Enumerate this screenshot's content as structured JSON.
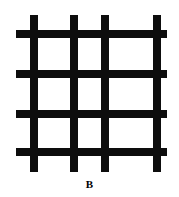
{
  "figure": {
    "label": "B",
    "label_position": {
      "center_x": 89,
      "baseline_y": 190
    },
    "label_font_size": 11,
    "canvas": {
      "width": 179,
      "height": 197
    },
    "background_color": "#ffffff",
    "stroke_color": "#0d0d0d",
    "bar_thickness": 8,
    "vertical_bars": [
      {
        "id": "v1",
        "x": 30,
        "y_start": 15,
        "y_end": 172
      },
      {
        "id": "v2",
        "x": 70,
        "y_start": 15,
        "y_end": 172
      },
      {
        "id": "v3",
        "x": 101,
        "y_start": 15,
        "y_end": 172
      },
      {
        "id": "v4",
        "x": 153,
        "y_start": 15,
        "y_end": 172
      }
    ],
    "horizontal_bars": [
      {
        "id": "h1",
        "y": 30,
        "x_start": 16,
        "x_end": 167
      },
      {
        "id": "h2",
        "y": 70,
        "x_start": 16,
        "x_end": 167
      },
      {
        "id": "h3",
        "y": 110,
        "x_start": 16,
        "x_end": 167
      },
      {
        "id": "h4",
        "y": 148,
        "x_start": 16,
        "x_end": 167
      }
    ]
  }
}
